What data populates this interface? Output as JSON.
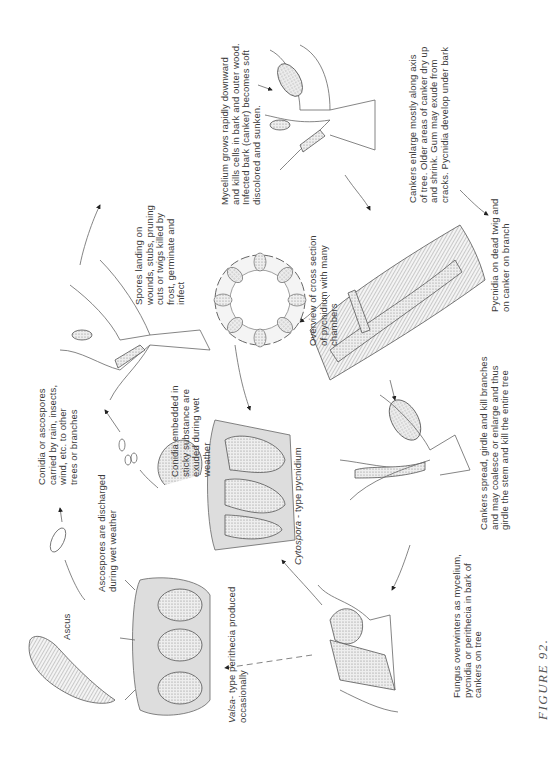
{
  "figure_caption": "FIGURE 92.",
  "orientation": "rotated-90-counterclockwise",
  "labels": {
    "ascus": "Ascus",
    "ascospores_discharged": "Ascospores are discharged\nduring wet weather",
    "valsa_type": "- type perithecia produced\noccasionally",
    "valsa_genus": "Valsa",
    "conidia_carried": "Conidia or ascospores\ncarried by rain, insects,\nwind, etc. to other\ntrees or branches",
    "conidia_embedded": "Conidia embedded in\nsticky substance are\nexuded during wet\nweather",
    "cytospora_genus": "Cytospora",
    "cytospora_type": " - type pycnidium",
    "fungus_overwinters": "Fungus overwinters as mycelium,\npycnidia or perithecia in bark of\ncankers on tree",
    "spores_landing": "Spores landing on\nwounds, stubs, pruning\ncuts or twigs killed by\nfrost, germinate and\ninfect",
    "cross_section": "Overview of cross section\nof pycnidium with many\nchambers",
    "cankers_spread": "Cankers spread, girdle and kill branches\nand may coalesce or enlarge and thus\ngirdle the stem and kill the entire tree",
    "mycelium_grows": "Mycelium grows rapidly downward\nand kills cells in bark and outer wood.\nInfected bark (canker) becomes soft\ndiscolored and sunken.",
    "pycnidia_dead_twig": "Pycnidia on dead twig and\non canker on branch",
    "cankers_enlarge": "Cankers enlarge mostly along axis\nof tree. Older areas of canker dry up\nand shrink. Gum may exude from\ncracks. Pycnidia develop under bark"
  }
}
